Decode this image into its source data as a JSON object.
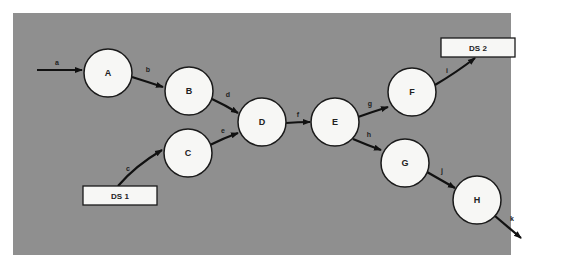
{
  "diagram": {
    "type": "data-flow-diagram",
    "panel_color": "#8f8f8f",
    "nodes": [
      {
        "id": "A",
        "label": "A",
        "cx": 108,
        "cy": 73
      },
      {
        "id": "B",
        "label": "B",
        "cx": 189,
        "cy": 91
      },
      {
        "id": "C",
        "label": "C",
        "cx": 188,
        "cy": 153
      },
      {
        "id": "D",
        "label": "D",
        "cx": 262,
        "cy": 122
      },
      {
        "id": "E",
        "label": "E",
        "cx": 335,
        "cy": 122
      },
      {
        "id": "F",
        "label": "F",
        "cx": 412,
        "cy": 92
      },
      {
        "id": "G",
        "label": "G",
        "cx": 405,
        "cy": 163
      },
      {
        "id": "H",
        "label": "H",
        "cx": 477,
        "cy": 200
      }
    ],
    "stores": [
      {
        "id": "DS1",
        "label": "DS 1"
      },
      {
        "id": "DS2",
        "label": "DS 2"
      }
    ],
    "edges": [
      {
        "label": "a",
        "from": "external",
        "to": "A"
      },
      {
        "label": "b",
        "from": "A",
        "to": "B"
      },
      {
        "label": "c",
        "from": "DS 1",
        "to": "C"
      },
      {
        "label": "d",
        "from": "B",
        "to": "D"
      },
      {
        "label": "e",
        "from": "C",
        "to": "D"
      },
      {
        "label": "f",
        "from": "D",
        "to": "E"
      },
      {
        "label": "g",
        "from": "E",
        "to": "F"
      },
      {
        "label": "h",
        "from": "E",
        "to": "G"
      },
      {
        "label": "i",
        "from": "F",
        "to": "DS 2"
      },
      {
        "label": "j",
        "from": "G",
        "to": "H"
      },
      {
        "label": "k",
        "from": "H",
        "to": "external"
      }
    ]
  }
}
